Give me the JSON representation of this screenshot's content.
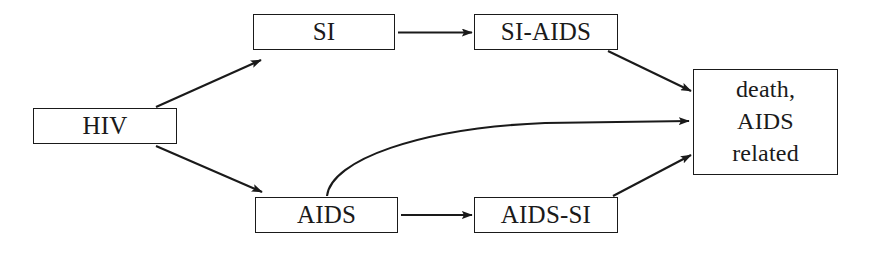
{
  "diagram": {
    "background_color": "#ffffff",
    "line_color": "#1a1a1a",
    "nodes": [
      {
        "id": "hiv",
        "label": "HIV"
      },
      {
        "id": "si",
        "label": "SI"
      },
      {
        "id": "si_aids",
        "label": "SI-AIDS"
      },
      {
        "id": "aids",
        "label": "AIDS"
      },
      {
        "id": "aids_si",
        "label": "AIDS-SI"
      },
      {
        "id": "death",
        "label": "death,\nAIDS\nrelated"
      }
    ],
    "edges": [
      {
        "id": "hiv-to-si",
        "from": "HIV",
        "to": "SI",
        "style": "straight-arrow"
      },
      {
        "id": "hiv-to-aids",
        "from": "HIV",
        "to": "AIDS",
        "style": "straight-arrow"
      },
      {
        "id": "si-to-si-aids",
        "from": "SI",
        "to": "SI-AIDS",
        "style": "straight-arrow"
      },
      {
        "id": "si-aids-to-death",
        "from": "SI-AIDS",
        "to": "death, AIDS related",
        "style": "straight-arrow"
      },
      {
        "id": "aids-to-aids-si",
        "from": "AIDS",
        "to": "AIDS-SI",
        "style": "straight-arrow"
      },
      {
        "id": "aids-si-to-death",
        "from": "AIDS-SI",
        "to": "death, AIDS related",
        "style": "straight-arrow"
      },
      {
        "id": "aids-to-death",
        "from": "AIDS",
        "to": "death, AIDS related",
        "style": "curved-arrow"
      }
    ]
  }
}
